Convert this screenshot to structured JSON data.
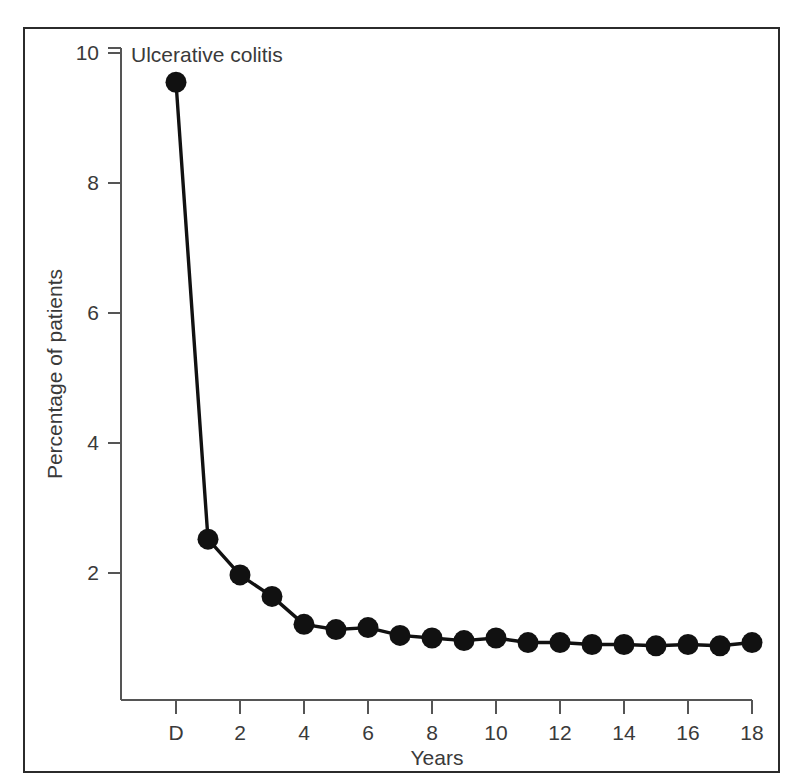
{
  "figure": {
    "frame_color": "#2b2b2b",
    "background": "#ffffff"
  },
  "chart_data": {
    "type": "line",
    "title": "Ulcerative colitis",
    "xlabel": "Years",
    "ylabel": "Percentage of patients",
    "x": [
      0,
      1,
      2,
      3,
      4,
      5,
      6,
      7,
      8,
      9,
      10,
      11,
      12,
      13,
      14,
      15,
      16,
      17,
      18
    ],
    "x_tick_labels": [
      "D",
      "2",
      "4",
      "6",
      "8",
      "10",
      "12",
      "14",
      "16",
      "18"
    ],
    "x_tick_values": [
      0,
      2,
      4,
      6,
      8,
      10,
      12,
      14,
      16,
      18
    ],
    "y_tick_labels": [
      "2",
      "4",
      "6",
      "8",
      "10"
    ],
    "y_tick_values": [
      2,
      4,
      6,
      8,
      10
    ],
    "values": [
      9.55,
      2.52,
      1.97,
      1.64,
      1.21,
      1.13,
      1.16,
      1.04,
      1.0,
      0.96,
      1.0,
      0.93,
      0.93,
      0.9,
      0.9,
      0.88,
      0.9,
      0.88,
      0.93
    ],
    "xlim": [
      -0.55,
      18.6
    ],
    "ylim": [
      0,
      10.55
    ],
    "grid": false,
    "legend": null,
    "marker": "filled-circle",
    "marker_color": "#111111",
    "line_color": "#111111",
    "series_name": "Ulcerative colitis"
  }
}
